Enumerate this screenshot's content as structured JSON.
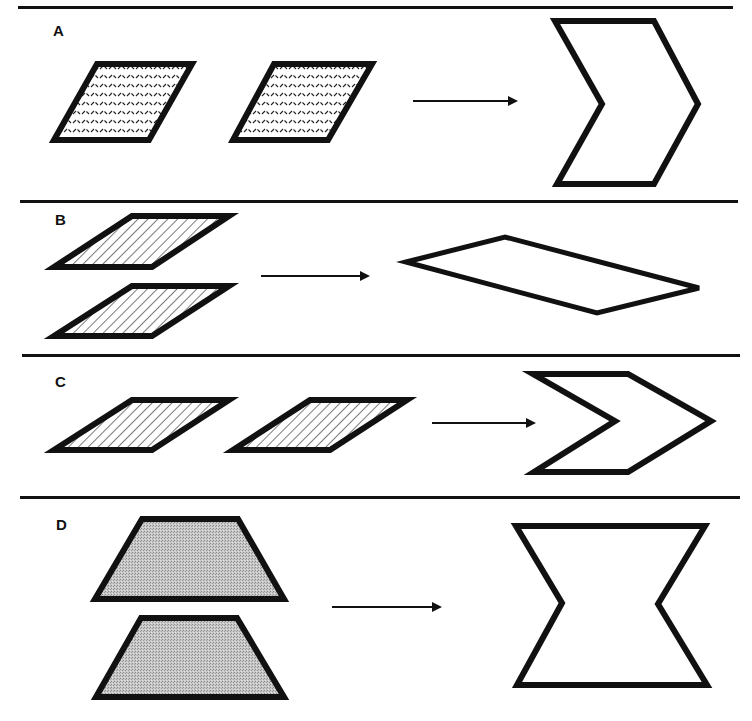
{
  "figure": {
    "panels": [
      {
        "id": "A",
        "label": "A",
        "inputs": 2,
        "input_shape": "rhombus",
        "input_fill": "dashed-texture",
        "layout": "side-by-side",
        "result_shape": "chevron (tall, vertical)"
      },
      {
        "id": "B",
        "label": "B",
        "inputs": 2,
        "input_shape": "flat parallelogram",
        "input_fill": "diagonal-hatch",
        "layout": "stacked",
        "result_shape": "long flat parallelogram"
      },
      {
        "id": "C",
        "label": "C",
        "inputs": 2,
        "input_shape": "flat parallelogram",
        "input_fill": "diagonal-hatch",
        "layout": "side-by-side",
        "result_shape": "chevron (wide, horizontal)"
      },
      {
        "id": "D",
        "label": "D",
        "inputs": 2,
        "input_shape": "trapezoid",
        "input_fill": "gray-stipple",
        "layout": "stacked",
        "result_shape": "hourglass / bow-tie hexagon"
      }
    ],
    "arrow_direction": "right",
    "colors": {
      "stroke": "#111111",
      "background": "#ffffff",
      "stipple": "#bdbdbd"
    }
  }
}
